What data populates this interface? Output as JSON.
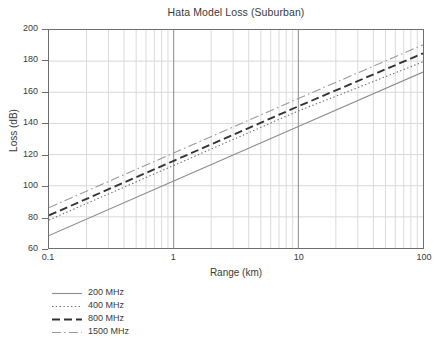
{
  "chart": {
    "title": "Hata Model Loss (Suburban)",
    "xlabel": "Range (km)",
    "ylabel": "Loss (dB)"
  },
  "axes": {
    "x_ticks": [
      "0.1",
      "1",
      "10",
      "100"
    ],
    "y_ticks": [
      "200",
      "180",
      "160",
      "140",
      "120",
      "100",
      "80",
      "60"
    ]
  },
  "legend": {
    "items": [
      {
        "label": "200 MHz",
        "style": "solid"
      },
      {
        "label": "400 MHz",
        "style": "dotted"
      },
      {
        "label": "800 MHz",
        "style": "dashed"
      },
      {
        "label": "1500 MHz",
        "style": "dashdot"
      }
    ]
  },
  "chart_data": {
    "type": "line",
    "title": "Hata Model Loss (Suburban)",
    "xlabel": "Range (km)",
    "ylabel": "Loss (dB)",
    "xscale": "log",
    "yscale": "linear",
    "xlim": [
      0.1,
      100
    ],
    "ylim": [
      60,
      200
    ],
    "grid": true,
    "legend_position": "below-left",
    "x": [
      0.1,
      1,
      10,
      100
    ],
    "series": [
      {
        "name": "200 MHz",
        "style": "solid",
        "color": "#8c8c8c",
        "values": [
          68.0,
          103.0,
          138.0,
          173.0
        ]
      },
      {
        "name": "400 MHz",
        "style": "dotted",
        "color": "#6e6e6e",
        "values": [
          78.0,
          113.0,
          148.0,
          179.5
        ]
      },
      {
        "name": "800 MHz",
        "style": "dashed",
        "color": "#333333",
        "values": [
          81.0,
          116.0,
          151.0,
          185.0
        ]
      },
      {
        "name": "1500 MHz",
        "style": "dashdot",
        "color": "#9a9a9a",
        "values": [
          86.0,
          121.0,
          156.0,
          190.5
        ]
      }
    ]
  }
}
